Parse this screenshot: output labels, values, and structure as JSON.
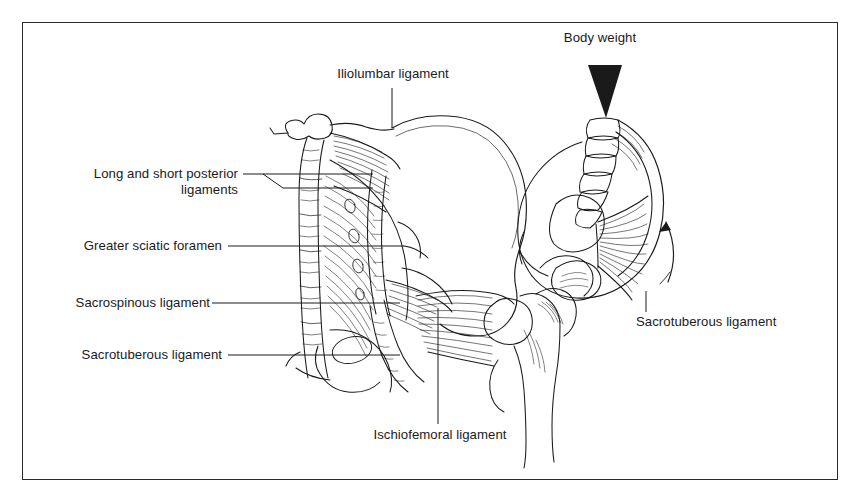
{
  "figure": {
    "kind": "anatomical-line-drawing",
    "border_color": "#2b2b2b",
    "ink_color": "#1a1a1a",
    "background_color": "#ffffff"
  },
  "labels": {
    "iliolumbar": "Iliolumbar ligament",
    "body_weight": "Body weight",
    "long_short_posterior_line1": "Long and short posterior",
    "long_short_posterior_line2": "ligaments",
    "greater_sciatic_foramen": "Greater sciatic foramen",
    "sacrospinous": "Sacrospinous ligament",
    "sacrotuberous_left": "Sacrotuberous ligament",
    "sacrotuberous_right": "Sacrotuberous ligament",
    "ischiofemoral": "Ischiofemoral ligament"
  },
  "icons": {
    "body_weight_arrow": "downward-wedge-arrow",
    "rotation_arrow": "curved-rotation-arrow"
  }
}
